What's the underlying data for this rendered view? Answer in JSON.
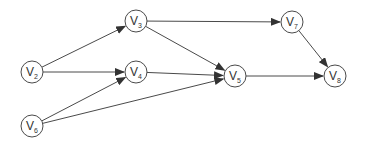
{
  "diagram": {
    "type": "directed-graph",
    "nodes": [
      {
        "id": "v2",
        "letter": "V",
        "sub": "2",
        "x": 32,
        "y": 72
      },
      {
        "id": "v3",
        "letter": "V",
        "sub": "3",
        "x": 136,
        "y": 21
      },
      {
        "id": "v4",
        "letter": "V",
        "sub": "4",
        "x": 136,
        "y": 72
      },
      {
        "id": "v6",
        "letter": "V",
        "sub": "6",
        "x": 32,
        "y": 126
      },
      {
        "id": "v5",
        "letter": "V",
        "sub": "5",
        "x": 235,
        "y": 76
      },
      {
        "id": "v7",
        "letter": "V",
        "sub": "7",
        "x": 292,
        "y": 22
      },
      {
        "id": "v8",
        "letter": "V",
        "sub": "8",
        "x": 335,
        "y": 76
      }
    ],
    "edges": [
      {
        "from": "v2",
        "to": "v3"
      },
      {
        "from": "v2",
        "to": "v4"
      },
      {
        "from": "v6",
        "to": "v4"
      },
      {
        "from": "v6",
        "to": "v5"
      },
      {
        "from": "v3",
        "to": "v5"
      },
      {
        "from": "v3",
        "to": "v7"
      },
      {
        "from": "v4",
        "to": "v5"
      },
      {
        "from": "v5",
        "to": "v8"
      },
      {
        "from": "v7",
        "to": "v8"
      }
    ],
    "colors": {
      "stroke": "#4a4a4a",
      "text": "#333333",
      "background": "#ffffff"
    }
  }
}
